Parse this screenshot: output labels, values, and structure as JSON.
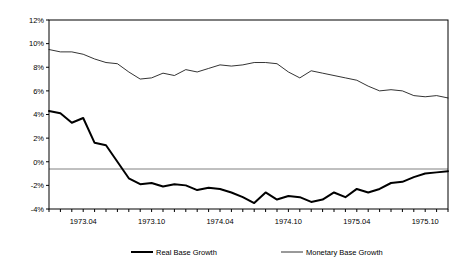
{
  "chart_data": {
    "type": "line",
    "title": "",
    "xlabel": "",
    "ylabel": "",
    "ylim": [
      -4,
      12
    ],
    "ytick_labels": [
      "12%",
      "10%",
      "8%",
      "6%",
      "4%",
      "2%",
      "0%",
      "-2%",
      "-4%"
    ],
    "ytick_values": [
      12,
      10,
      8,
      6,
      4,
      2,
      0,
      -2,
      -4
    ],
    "xtick_labels": [
      "1973.04",
      "1973.10",
      "1974.04",
      "1974.10",
      "1975.04",
      "1975.10"
    ],
    "xtick_indices": [
      3,
      9,
      15,
      21,
      27,
      33
    ],
    "x": [
      "1973.01",
      "1973.02",
      "1973.03",
      "1973.04",
      "1973.05",
      "1973.06",
      "1973.07",
      "1973.08",
      "1973.09",
      "1973.10",
      "1973.11",
      "1973.12",
      "1974.01",
      "1974.02",
      "1974.03",
      "1974.04",
      "1974.05",
      "1974.06",
      "1974.07",
      "1974.08",
      "1974.09",
      "1974.10",
      "1974.11",
      "1974.12",
      "1975.01",
      "1975.02",
      "1975.03",
      "1975.04",
      "1975.05",
      "1975.06",
      "1975.07",
      "1975.08",
      "1975.09",
      "1975.10",
      "1975.11",
      "1975.12"
    ],
    "grid": false,
    "zero_line": true,
    "legend_position": "bottom",
    "series": [
      {
        "name": "Real Base Growth",
        "color": "#000000",
        "width": 2.0,
        "values": [
          4.3,
          4.1,
          3.3,
          3.7,
          1.6,
          1.4,
          0.0,
          -1.4,
          -1.9,
          -1.8,
          -2.1,
          -1.9,
          -2.0,
          -2.4,
          -2.2,
          -2.3,
          -2.6,
          -3.0,
          -3.5,
          -2.6,
          -3.2,
          -2.9,
          -3.0,
          -3.4,
          -3.2,
          -2.6,
          -3.0,
          -2.3,
          -2.6,
          -2.3,
          -1.8,
          -1.7,
          -1.3,
          -1.0,
          -0.9,
          -0.8
        ]
      },
      {
        "name": "Monetary Base Growth",
        "color": "#000000",
        "width": 0.8,
        "values": [
          9.5,
          9.3,
          9.3,
          9.1,
          8.7,
          8.4,
          8.3,
          7.6,
          7.0,
          7.1,
          7.5,
          7.3,
          7.8,
          7.6,
          7.9,
          8.2,
          8.1,
          8.2,
          8.4,
          8.4,
          8.3,
          7.6,
          7.1,
          7.7,
          7.5,
          7.3,
          7.1,
          6.9,
          6.4,
          6.0,
          6.1,
          6.0,
          5.6,
          5.5,
          5.6,
          5.4
        ]
      }
    ]
  },
  "legend": {
    "items": [
      {
        "label": "Real Base Growth"
      },
      {
        "label": "Monetary Base Growth"
      }
    ]
  },
  "axes": {
    "border_color": "#000000",
    "zero_line_color": "#808080"
  }
}
